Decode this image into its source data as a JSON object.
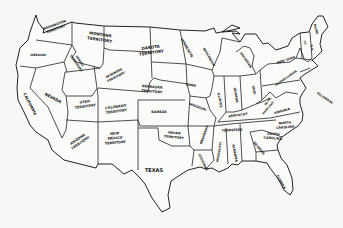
{
  "map": {
    "title": "United States and Territories",
    "colors": {
      "background": "#f7f7f5",
      "land": "#fbfbfa",
      "ink": "#222222"
    },
    "labels": [
      {
        "id": "washington",
        "text": "WASHINGTON",
        "text2": "TERRITORY",
        "x": 55,
        "y": 27,
        "r": -20,
        "s": 3.2
      },
      {
        "id": "oregon",
        "text": "OREGON",
        "x": 38,
        "y": 55,
        "r": 0,
        "s": 3.2
      },
      {
        "id": "idaho",
        "text": "IDAHO",
        "text2": "TERRITORY",
        "x": 78,
        "y": 62,
        "r": 55,
        "s": 3.2
      },
      {
        "id": "montana",
        "text": "MONTANA",
        "text2": "TERRITORY",
        "x": 100,
        "y": 37,
        "r": 8,
        "s": 4
      },
      {
        "id": "wyoming",
        "text": "WYOMING",
        "text2": "TERRITORY",
        "x": 115,
        "y": 75,
        "r": -28,
        "s": 3.2
      },
      {
        "id": "dakota",
        "text": "DAKOTA",
        "text2": "TERRITORY",
        "x": 151,
        "y": 50,
        "r": -8,
        "s": 4
      },
      {
        "id": "california",
        "text": "CALIFORNIA",
        "x": 30,
        "y": 104,
        "r": 62,
        "s": 3.6
      },
      {
        "id": "nevada",
        "text": "NEVADA",
        "x": 53,
        "y": 98,
        "r": 28,
        "s": 4
      },
      {
        "id": "utah",
        "text": "UTAH",
        "text2": "TERRITORY",
        "x": 85,
        "y": 104,
        "r": -8,
        "s": 3.4
      },
      {
        "id": "colorado",
        "text": "COLORADO",
        "text2": "TERRITORY",
        "x": 116,
        "y": 109,
        "r": -8,
        "s": 3.4
      },
      {
        "id": "nebraska",
        "text": "NEBRASKA",
        "text2": "TERRITORY",
        "x": 152,
        "y": 89,
        "r": 5,
        "s": 3.4
      },
      {
        "id": "kansas",
        "text": "KANSAS",
        "x": 159,
        "y": 112,
        "r": 0,
        "s": 3.4
      },
      {
        "id": "arizona",
        "text": "ARIZONA",
        "text2": "TERRITORY",
        "x": 79,
        "y": 141,
        "r": -35,
        "s": 3.4
      },
      {
        "id": "new-mexico",
        "text": "NEW",
        "text2": "MEXICO",
        "text3": "TERRITORY",
        "x": 115,
        "y": 138,
        "r": -5,
        "s": 3.4
      },
      {
        "id": "indian",
        "text": "INDIAN",
        "text2": "TERRITORY",
        "x": 174,
        "y": 135,
        "r": 5,
        "s": 3.2
      },
      {
        "id": "texas",
        "text": "TEXAS",
        "x": 154,
        "y": 170,
        "r": 0,
        "s": 5
      },
      {
        "id": "minnesota",
        "text": "MINNESOTA",
        "x": 187,
        "y": 48,
        "r": 60,
        "s": 3.2
      },
      {
        "id": "wisconsin",
        "text": "WISCONSIN",
        "x": 209,
        "y": 57,
        "r": 60,
        "s": 3.2
      },
      {
        "id": "michigan",
        "text": "MICHIGAN",
        "x": 246,
        "y": 60,
        "r": 55,
        "s": 3.2
      },
      {
        "id": "iowa",
        "text": "IOWA",
        "x": 191,
        "y": 85,
        "r": 8,
        "s": 3.4
      },
      {
        "id": "missouri",
        "text": "MISSOURI",
        "x": 198,
        "y": 107,
        "r": 20,
        "s": 3.2
      },
      {
        "id": "illinois",
        "text": "ILLINOIS",
        "x": 220,
        "y": 100,
        "r": 80,
        "s": 3.2
      },
      {
        "id": "indiana",
        "text": "INDIANA",
        "x": 236,
        "y": 95,
        "r": 80,
        "s": 3.2
      },
      {
        "id": "ohio",
        "text": "OHIO",
        "x": 254,
        "y": 90,
        "r": 80,
        "s": 3.2
      },
      {
        "id": "kentucky",
        "text": "KENTUCKY",
        "x": 238,
        "y": 115,
        "r": -8,
        "s": 3.2
      },
      {
        "id": "west-virginia",
        "text": "W.VA.",
        "x": 268,
        "y": 101,
        "r": -50,
        "s": 3
      },
      {
        "id": "virginia",
        "text": "VIRGINIA",
        "x": 282,
        "y": 111,
        "r": -15,
        "s": 3.2
      },
      {
        "id": "tennessee",
        "text": "TENNESSEE",
        "x": 232,
        "y": 130,
        "r": -3,
        "s": 3.2
      },
      {
        "id": "north-carolina",
        "text": "NORTH",
        "text2": "CAROLINA",
        "x": 285,
        "y": 125,
        "r": -5,
        "s": 3.2
      },
      {
        "id": "south-carolina",
        "text": "SOUTH",
        "text2": "CAROLINA",
        "x": 273,
        "y": 136,
        "r": 5,
        "s": 3.2
      },
      {
        "id": "arkansas",
        "text": "ARKANSAS",
        "x": 204,
        "y": 135,
        "r": -70,
        "s": 3.2
      },
      {
        "id": "louisiana",
        "text": "LOUISIANA",
        "x": 203,
        "y": 162,
        "r": 65,
        "s": 3
      },
      {
        "id": "mississippi",
        "text": "MISSISSIPPI",
        "x": 219,
        "y": 152,
        "r": -80,
        "s": 3
      },
      {
        "id": "alabama",
        "text": "ALABAMA",
        "x": 235,
        "y": 153,
        "r": 80,
        "s": 3.2
      },
      {
        "id": "georgia",
        "text": "GEORGIA",
        "x": 259,
        "y": 148,
        "r": 50,
        "s": 3.2
      },
      {
        "id": "florida",
        "text": "FLORIDA",
        "x": 281,
        "y": 182,
        "r": 60,
        "s": 3.2
      },
      {
        "id": "new-york",
        "text": "NEW YORK",
        "x": 286,
        "y": 60,
        "r": -18,
        "s": 3.2
      },
      {
        "id": "pennsylvania",
        "text": "PENNSYLVANIA",
        "x": 286,
        "y": 78,
        "r": -35,
        "s": 3
      },
      {
        "id": "maine",
        "text": "MAINE",
        "x": 316,
        "y": 29,
        "r": 75,
        "s": 3
      },
      {
        "id": "vermont",
        "text": "VT.",
        "x": 305,
        "y": 43,
        "r": 80,
        "s": 2.8
      },
      {
        "id": "new-hampshire",
        "text": "N.H.",
        "x": 312,
        "y": 48,
        "r": 80,
        "s": 2.8
      },
      {
        "id": "maryland",
        "text": "MARYLAND",
        "x": 268,
        "y": 108,
        "r": -50,
        "s": 2.6
      },
      {
        "id": "delaware",
        "text": "DELAWARE",
        "x": 325,
        "y": 98,
        "r": 35,
        "s": 3
      }
    ]
  }
}
